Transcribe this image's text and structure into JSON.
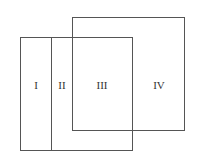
{
  "diagram": {
    "regions": [
      {
        "id": "I",
        "label": "I"
      },
      {
        "id": "II",
        "label": "II"
      },
      {
        "id": "III",
        "label": "III"
      },
      {
        "id": "IV",
        "label": "IV"
      }
    ],
    "line_color": "#555555"
  }
}
